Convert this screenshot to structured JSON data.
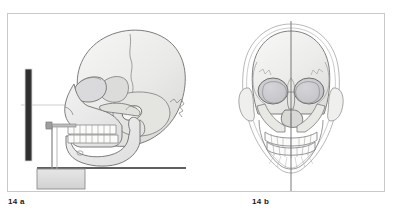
{
  "plate": {
    "title": "Skull measurement figure plate",
    "background_color": "#ffffff",
    "frame_border_color": "#c9c9c9"
  },
  "panels": [
    {
      "id": "panel-a",
      "caption": "14 a",
      "view": "lateral skull with craniometric measuring apparatus",
      "elements": {
        "skull_label": "lateral skull",
        "scale_bar_label": "vertical dark measuring scale",
        "base_block_label": "instrument base block",
        "rod_label": "vertical support rod",
        "arm_label": "horizontal measuring arm",
        "reference_line_label": "Frankfurt horizontal reference line",
        "baseline_label": "baseline"
      },
      "colors": {
        "bone_fill": "#e8e8e6",
        "bone_outline": "#6b6b6b",
        "scale_bar": "#3a3a3a",
        "block_fill": "#dcdcdc",
        "block_outline": "#8d8d8d",
        "line": "#2b2b2b",
        "reference_line": "#b9b9b9"
      }
    },
    {
      "id": "panel-b",
      "caption": "14 b",
      "view": "frontal skull with vertical midline axis",
      "elements": {
        "skull_label": "frontal skull",
        "midline_label": "median sagittal axis line",
        "head_outline_label": "soft tissue head outline",
        "orbit_label": "orbital cavity",
        "nasal_label": "nasal aperture",
        "teeth_label": "dental arch"
      },
      "colors": {
        "bone_fill": "#e9e9e7",
        "bone_outline": "#707070",
        "orbit_fill": "#c9c9cd",
        "midline": "#6b6b6b",
        "soft_outline": "#9a9a9a"
      }
    }
  ]
}
